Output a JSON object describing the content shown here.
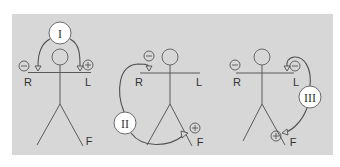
{
  "colors": {
    "panel": "#d7d7d7",
    "line": "#5a5a5a",
    "circle_fill": "#ffffff"
  },
  "figures": [
    {
      "lead": "I",
      "labels": {
        "right_arm": "R",
        "left_arm": "L",
        "foot": "F"
      },
      "negative": "⊖ at R (right arm)",
      "positive": "⊕ at L (left arm)"
    },
    {
      "lead": "II",
      "labels": {
        "right_arm": "R",
        "left_arm": "L",
        "foot": "F"
      },
      "negative": "⊖ at R (right arm)",
      "positive": "⊕ at F (foot)"
    },
    {
      "lead": "III",
      "labels": {
        "right_arm": "R",
        "left_arm": "L",
        "foot": "F"
      },
      "negative": "⊖ at L (left arm)",
      "positive": "⊕ at F (foot)",
      "extra": "⊖ also shown near R"
    }
  ]
}
